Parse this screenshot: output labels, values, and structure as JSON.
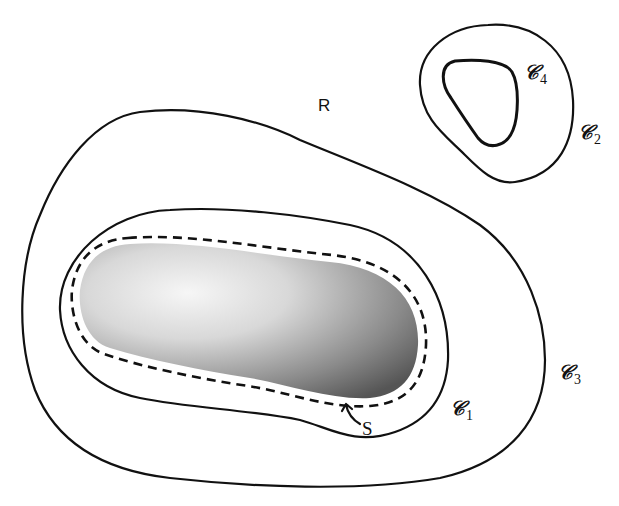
{
  "diagram": {
    "region_label": "R",
    "surface_label": "S",
    "curves": [
      {
        "id": "C1",
        "symbol": "𝒞",
        "subscript": "1"
      },
      {
        "id": "C2",
        "symbol": "𝒞",
        "subscript": "2"
      },
      {
        "id": "C3",
        "symbol": "𝒞",
        "subscript": "3"
      },
      {
        "id": "C4",
        "symbol": "𝒞",
        "subscript": "4"
      }
    ],
    "colors": {
      "stroke": "#111111",
      "shade_dark": "#555555",
      "shade_light": "#f4f4f4",
      "background": "#ffffff"
    }
  }
}
